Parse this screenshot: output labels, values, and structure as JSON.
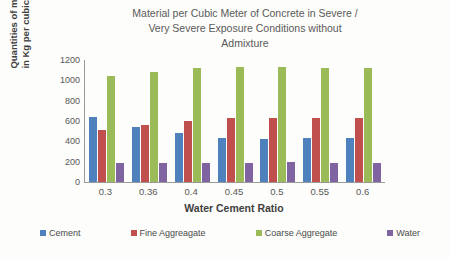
{
  "chart_data": {
    "type": "bar",
    "title": "Material per Cubic Meter of Concrete in Severe / Very Severe Exposure Conditions without Admixture",
    "title_lines": [
      "Material per Cubic Meter of Concrete in Severe /",
      "Very Severe Exposure Conditions without",
      "Admixture"
    ],
    "xlabel": "Water Cement Ratio",
    "ylabel": "Quantities of material in Kg per cubic meter",
    "ylabel_lines": [
      "Quantities of material",
      "in Kg per cubic meter"
    ],
    "categories": [
      "0.3",
      "0.36",
      "0.4",
      "0.45",
      "0.5",
      "0.55",
      "0.6"
    ],
    "ylim": [
      0,
      1200
    ],
    "yticks": [
      0,
      200,
      400,
      600,
      800,
      1000,
      1200
    ],
    "grid": false,
    "legend_position": "bottom",
    "series": [
      {
        "name": "Cement",
        "color": "#4f81bd",
        "values": [
          640,
          540,
          480,
          430,
          425,
          430,
          430
        ]
      },
      {
        "name": "Fine Aggreagate",
        "color": "#c0504d",
        "values": [
          510,
          560,
          600,
          625,
          630,
          625,
          625
        ]
      },
      {
        "name": "Coarse Aggregate",
        "color": "#9bbb59",
        "values": [
          1040,
          1085,
          1120,
          1130,
          1130,
          1125,
          1125
        ]
      },
      {
        "name": "Water",
        "color": "#8064a2",
        "values": [
          190,
          190,
          190,
          190,
          195,
          190,
          190
        ]
      }
    ]
  }
}
